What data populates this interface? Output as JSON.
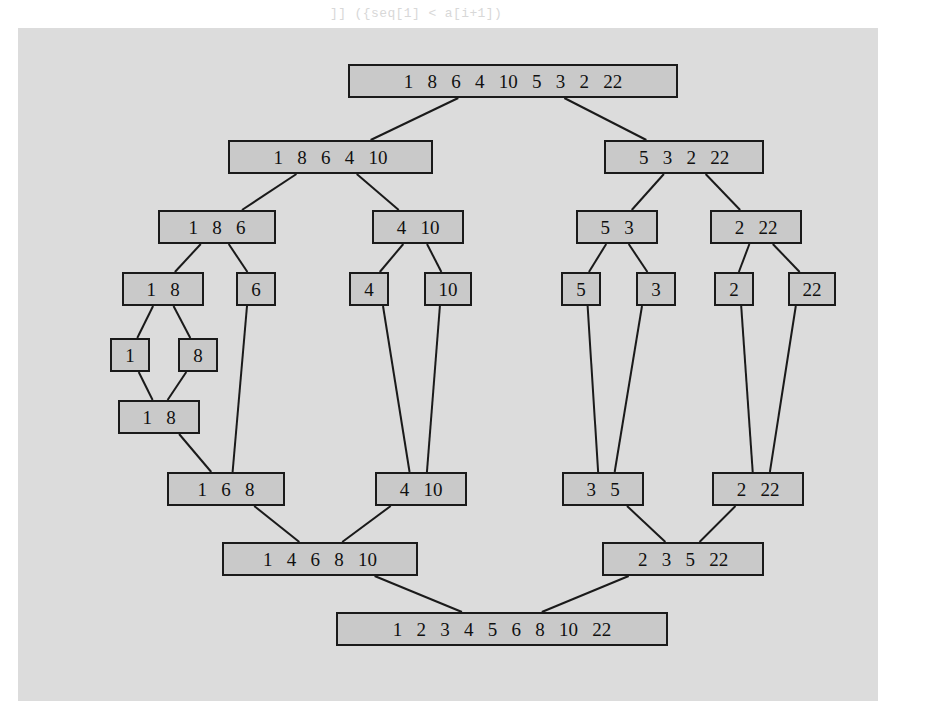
{
  "figure": {
    "input_array": "1 8 6 4 10 5 3 2 22",
    "sorted_array": "1 2 3 4 5 6 8 10 22",
    "plate_color": "#dcdcdc",
    "node_fill": "#c9c9c9",
    "node_border": "#1a1a1a",
    "page_background": "#ffffff"
  },
  "nodes": [
    {
      "id": "root",
      "values": "1   8   6   4   10   5   3   2   22",
      "x": 348,
      "y": 64,
      "w": 330
    },
    {
      "id": "split-l1",
      "values": "1   8   6   4   10",
      "x": 228,
      "y": 140,
      "w": 205
    },
    {
      "id": "split-r1",
      "values": "5   3   2   22",
      "x": 604,
      "y": 140,
      "w": 160
    },
    {
      "id": "split-l2a",
      "values": "1   8   6",
      "x": 158,
      "y": 210,
      "w": 118
    },
    {
      "id": "split-l2b",
      "values": "4   10",
      "x": 372,
      "y": 210,
      "w": 92
    },
    {
      "id": "split-r2a",
      "values": "5   3",
      "x": 576,
      "y": 210,
      "w": 82
    },
    {
      "id": "split-r2b",
      "values": "2   22",
      "x": 710,
      "y": 210,
      "w": 92
    },
    {
      "id": "split-l3a",
      "values": "1   8",
      "x": 122,
      "y": 272,
      "w": 82
    },
    {
      "id": "split-l3b",
      "values": "6",
      "x": 236,
      "y": 272,
      "w": 40
    },
    {
      "id": "split-l3c",
      "values": "4",
      "x": 349,
      "y": 272,
      "w": 40
    },
    {
      "id": "split-l3d",
      "values": "10",
      "x": 424,
      "y": 272,
      "w": 48
    },
    {
      "id": "split-r3a",
      "values": "5",
      "x": 561,
      "y": 272,
      "w": 40
    },
    {
      "id": "split-r3b",
      "values": "3",
      "x": 636,
      "y": 272,
      "w": 40
    },
    {
      "id": "split-r3c",
      "values": "2",
      "x": 714,
      "y": 272,
      "w": 40
    },
    {
      "id": "split-r3d",
      "values": "22",
      "x": 788,
      "y": 272,
      "w": 48
    },
    {
      "id": "leaf-1",
      "values": "1",
      "x": 110,
      "y": 338,
      "w": 40
    },
    {
      "id": "leaf-8",
      "values": "8",
      "x": 178,
      "y": 338,
      "w": 40
    },
    {
      "id": "merge-18",
      "values": "1   8",
      "x": 118,
      "y": 400,
      "w": 82
    },
    {
      "id": "merge-168",
      "values": "1   6   8",
      "x": 167,
      "y": 472,
      "w": 118
    },
    {
      "id": "merge-410",
      "values": "4   10",
      "x": 375,
      "y": 472,
      "w": 92
    },
    {
      "id": "merge-35",
      "values": "3   5",
      "x": 562,
      "y": 472,
      "w": 82
    },
    {
      "id": "merge-222",
      "values": "2   22",
      "x": 712,
      "y": 472,
      "w": 92
    },
    {
      "id": "merge-l",
      "values": "1   4   6   8   10",
      "x": 222,
      "y": 542,
      "w": 196
    },
    {
      "id": "merge-r",
      "values": "2   3   5   22",
      "x": 602,
      "y": 542,
      "w": 162
    },
    {
      "id": "final",
      "values": "1   2   3   4   5   6   8   10   22",
      "x": 336,
      "y": 612,
      "w": 332
    }
  ],
  "edges": [
    {
      "from": "root",
      "to": "split-l1"
    },
    {
      "from": "root",
      "to": "split-r1"
    },
    {
      "from": "split-l1",
      "to": "split-l2a"
    },
    {
      "from": "split-l1",
      "to": "split-l2b"
    },
    {
      "from": "split-r1",
      "to": "split-r2a"
    },
    {
      "from": "split-r1",
      "to": "split-r2b"
    },
    {
      "from": "split-l2a",
      "to": "split-l3a"
    },
    {
      "from": "split-l2a",
      "to": "split-l3b"
    },
    {
      "from": "split-l2b",
      "to": "split-l3c"
    },
    {
      "from": "split-l2b",
      "to": "split-l3d"
    },
    {
      "from": "split-r2a",
      "to": "split-r3a"
    },
    {
      "from": "split-r2a",
      "to": "split-r3b"
    },
    {
      "from": "split-r2b",
      "to": "split-r3c"
    },
    {
      "from": "split-r2b",
      "to": "split-r3d"
    },
    {
      "from": "split-l3a",
      "to": "leaf-1"
    },
    {
      "from": "split-l3a",
      "to": "leaf-8"
    },
    {
      "from": "leaf-1",
      "to": "merge-18"
    },
    {
      "from": "leaf-8",
      "to": "merge-18"
    },
    {
      "from": "merge-18",
      "to": "merge-168"
    },
    {
      "from": "split-l3b",
      "to": "merge-168"
    },
    {
      "from": "split-l3c",
      "to": "merge-410"
    },
    {
      "from": "split-l3d",
      "to": "merge-410"
    },
    {
      "from": "split-r3a",
      "to": "merge-35"
    },
    {
      "from": "split-r3b",
      "to": "merge-35"
    },
    {
      "from": "split-r3c",
      "to": "merge-222"
    },
    {
      "from": "split-r3d",
      "to": "merge-222"
    },
    {
      "from": "merge-168",
      "to": "merge-l"
    },
    {
      "from": "merge-410",
      "to": "merge-l"
    },
    {
      "from": "merge-35",
      "to": "merge-r"
    },
    {
      "from": "merge-222",
      "to": "merge-r"
    },
    {
      "from": "merge-l",
      "to": "final"
    },
    {
      "from": "merge-r",
      "to": "final"
    }
  ],
  "background_text": {
    "top_line": "]] ({seq[1] < a[i+1])",
    "lines": [
      "l[j+1]a[j] < a[j+1];",
      "j = a[j]; a[j] = temp;",
      "l[i]); int elem2 = count( a[ i ] );",
      "j[i]) ; int[] a ) {",
      "a[0] = 0; a[1] = 1;"
    ],
    "paragraph": "of an array of n elements into an array of n\nelements can be done in time proportional to n.\nThe merge sort algorithm splits the array in half,\nsorts each half recursively, and then merges the\ntwo sorted halves into a single sorted array.\nThe overall running time of the algorithm is\nO(n log n), which is substantially better than\nthe O(n^2) time of insertion sort on large inputs.",
    "lower_lines": [
      "[] a, int lo, int hi ) {",
      "lo) / 2;",
      "a, lo, mid );",
      "a, mid+1, hi );",
      "( a, lo, mid, hi );",
      "int[] b = new int[ n ];",
      "( a[i], a[j] );",
      "(b[k], a[k]);"
    ]
  }
}
